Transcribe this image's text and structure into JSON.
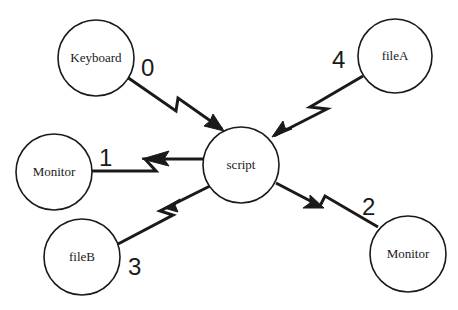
{
  "diagram": {
    "width": 458,
    "height": 310,
    "stroke_color": "#1a1a1a",
    "background": "#ffffff",
    "nodes": [
      {
        "id": "keyboard",
        "label": "Keyboard",
        "cx": 96,
        "cy": 58,
        "r": 38
      },
      {
        "id": "fileA",
        "label": "fileA",
        "cx": 395,
        "cy": 56,
        "r": 37
      },
      {
        "id": "script",
        "label": "script",
        "cx": 241,
        "cy": 165,
        "r": 38
      },
      {
        "id": "monitor-left",
        "label": "Monitor",
        "cx": 54,
        "cy": 172,
        "r": 38
      },
      {
        "id": "fileB",
        "label": "fileB",
        "cx": 82,
        "cy": 257,
        "r": 38
      },
      {
        "id": "monitor-right",
        "label": "Monitor",
        "cx": 408,
        "cy": 254,
        "r": 38
      }
    ],
    "edges": [
      {
        "id": "edge-0",
        "label": "0",
        "from": "keyboard",
        "to": "script",
        "points": [
          [
            127,
            77
          ],
          [
            176,
            111
          ],
          [
            178,
            98
          ],
          [
            222,
            129
          ]
        ],
        "arrow": [
          [
            224,
            131
          ],
          [
            204,
            126
          ],
          [
            210,
            121
          ],
          [
            213,
            114
          ]
        ],
        "label_x": 141,
        "label_y": 76
      },
      {
        "id": "edge-4",
        "label": "4",
        "from": "fileA",
        "to": "script",
        "points": [
          [
            363,
            76
          ],
          [
            310,
            107
          ],
          [
            327,
            109
          ],
          [
            274,
            136
          ]
        ],
        "arrow": [
          [
            272,
            137
          ],
          [
            283,
            121
          ],
          [
            285,
            128
          ],
          [
            292,
            129
          ]
        ],
        "label_x": 332,
        "label_y": 68
      },
      {
        "id": "edge-1",
        "label": "1",
        "from": "script",
        "to": "monitor-left",
        "points": [
          [
            204,
            159
          ],
          [
            145,
            159
          ],
          [
            156,
            171
          ],
          [
            91,
            171
          ]
        ],
        "arrow": [
          [
            142,
            159
          ],
          [
            169,
            151
          ],
          [
            164,
            159
          ],
          [
            169,
            166
          ]
        ],
        "label_x": 99,
        "label_y": 166
      },
      {
        "id": "edge-3",
        "label": "3",
        "from": "script",
        "to": "fileB",
        "points": [
          [
            210,
            186
          ],
          [
            160,
            211
          ],
          [
            173,
            215
          ],
          [
            118,
            244
          ]
        ],
        "arrow": [
          [
            164,
            208
          ],
          [
            180,
            199
          ],
          [
            175,
            205
          ],
          [
            178,
            212
          ]
        ],
        "label_x": 128,
        "label_y": 275
      },
      {
        "id": "edge-2",
        "label": "2",
        "from": "script",
        "to": "monitor-right",
        "points": [
          [
            276,
            183
          ],
          [
            320,
            206
          ],
          [
            325,
            196
          ],
          [
            378,
            227
          ]
        ],
        "arrow": [
          [
            324,
            208
          ],
          [
            303,
            208
          ],
          [
            310,
            203
          ],
          [
            310,
            195
          ]
        ],
        "label_x": 362,
        "label_y": 215
      }
    ]
  }
}
